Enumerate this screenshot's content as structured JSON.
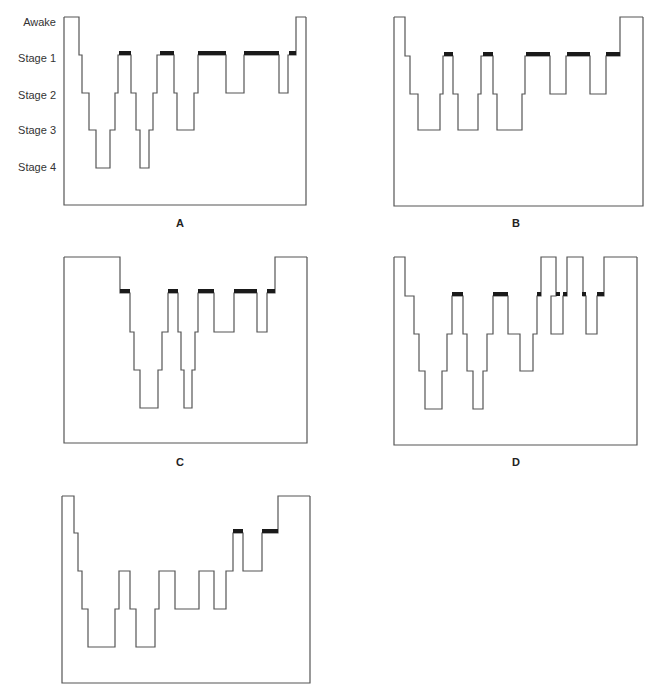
{
  "figure": {
    "stage_labels": [
      "Awake",
      "Stage 1",
      "Stage 2",
      "Stage 3",
      "Stage 4"
    ],
    "panels": [
      {
        "letter": "A",
        "box": {
          "x": 64,
          "y": 17,
          "w": 242,
          "h": 188
        },
        "levels": [
          17,
          55,
          93,
          130,
          168
        ],
        "letter_pos": {
          "x": 170,
          "y": 217
        },
        "steps": [
          [
            64,
            0
          ],
          [
            79,
            1
          ],
          [
            82,
            2
          ],
          [
            89,
            3
          ],
          [
            96,
            4
          ],
          [
            110,
            3
          ],
          [
            115,
            2
          ],
          [
            118,
            1
          ],
          [
            131,
            2
          ],
          [
            136,
            3
          ],
          [
            140,
            4
          ],
          [
            149,
            3
          ],
          [
            153,
            2
          ],
          [
            157,
            1
          ],
          [
            174,
            2
          ],
          [
            177,
            3
          ],
          [
            194,
            2
          ],
          [
            198,
            1
          ],
          [
            226,
            2
          ],
          [
            244,
            1
          ],
          [
            279,
            2
          ],
          [
            288,
            1
          ],
          [
            296,
            0
          ],
          [
            306,
            0
          ]
        ],
        "rem": [
          [
            119,
            131
          ],
          [
            160,
            174
          ],
          [
            198,
            226
          ],
          [
            244,
            279
          ],
          [
            289,
            296
          ]
        ]
      },
      {
        "letter": "B",
        "box": {
          "x": 394,
          "y": 17,
          "w": 249,
          "h": 189
        },
        "levels": [
          17,
          56,
          94,
          130,
          168
        ],
        "letter_pos": {
          "x": 506,
          "y": 217
        },
        "steps": [
          [
            394,
            0
          ],
          [
            405,
            1
          ],
          [
            410,
            2
          ],
          [
            418,
            3
          ],
          [
            440,
            2
          ],
          [
            443,
            1
          ],
          [
            453,
            2
          ],
          [
            458,
            3
          ],
          [
            478,
            2
          ],
          [
            481,
            1
          ],
          [
            493,
            2
          ],
          [
            497,
            3
          ],
          [
            522,
            2
          ],
          [
            525,
            1
          ],
          [
            550,
            2
          ],
          [
            566,
            1
          ],
          [
            590,
            2
          ],
          [
            606,
            1
          ],
          [
            620,
            0
          ],
          [
            643,
            0
          ]
        ],
        "rem": [
          [
            444,
            453
          ],
          [
            483,
            493
          ],
          [
            526,
            550
          ],
          [
            567,
            590
          ],
          [
            606,
            620
          ]
        ]
      },
      {
        "letter": "C",
        "box": {
          "x": 64,
          "y": 257,
          "w": 243,
          "h": 186
        },
        "levels": [
          257,
          293,
          332,
          370,
          408
        ],
        "letter_pos": {
          "x": 170,
          "y": 456
        },
        "steps": [
          [
            64,
            0
          ],
          [
            120,
            1
          ],
          [
            130,
            2
          ],
          [
            134,
            3
          ],
          [
            140,
            4
          ],
          [
            158,
            3
          ],
          [
            162,
            2
          ],
          [
            168,
            1
          ],
          [
            178,
            2
          ],
          [
            181,
            3
          ],
          [
            184,
            4
          ],
          [
            192,
            3
          ],
          [
            195,
            2
          ],
          [
            198,
            1
          ],
          [
            214,
            2
          ],
          [
            234,
            1
          ],
          [
            257,
            2
          ],
          [
            267,
            1
          ],
          [
            275,
            0
          ],
          [
            307,
            0
          ]
        ],
        "rem": [
          [
            120,
            130
          ],
          [
            168,
            178
          ],
          [
            198,
            214
          ],
          [
            234,
            257
          ],
          [
            267,
            275
          ]
        ]
      },
      {
        "letter": "D",
        "box": {
          "x": 394,
          "y": 257,
          "w": 243,
          "h": 188
        },
        "levels": [
          257,
          296,
          334,
          371,
          409
        ],
        "letter_pos": {
          "x": 506,
          "y": 456
        },
        "steps": [
          [
            394,
            0
          ],
          [
            405,
            1
          ],
          [
            414,
            2
          ],
          [
            419,
            3
          ],
          [
            425,
            4
          ],
          [
            442,
            3
          ],
          [
            447,
            2
          ],
          [
            452,
            1
          ],
          [
            463,
            2
          ],
          [
            467,
            3
          ],
          [
            473,
            4
          ],
          [
            483,
            3
          ],
          [
            487,
            2
          ],
          [
            493,
            1
          ],
          [
            508,
            2
          ],
          [
            520,
            3
          ],
          [
            533,
            2
          ],
          [
            537,
            1
          ],
          [
            541,
            0
          ],
          [
            556,
            1
          ],
          [
            551,
            2
          ],
          [
            563,
            2
          ],
          [
            563,
            1
          ],
          [
            567,
            0
          ],
          [
            581,
            0
          ],
          [
            583,
            1
          ],
          [
            586,
            2
          ],
          [
            596,
            2
          ],
          [
            597,
            1
          ],
          [
            604,
            0
          ],
          [
            637,
            0
          ]
        ],
        "rem": [
          [
            452,
            463
          ],
          [
            493,
            508
          ],
          [
            537,
            541
          ],
          [
            556,
            560
          ],
          [
            563,
            567
          ],
          [
            582,
            586
          ],
          [
            597,
            604
          ]
        ]
      },
      {
        "letter": "E",
        "box": {
          "x": 62,
          "y": 496,
          "w": 248,
          "h": 187
        },
        "levels": [
          496,
          533,
          571,
          609,
          647
        ],
        "letter_pos": null,
        "steps": [
          [
            62,
            0
          ],
          [
            74,
            1
          ],
          [
            78,
            2
          ],
          [
            82,
            3
          ],
          [
            88,
            4
          ],
          [
            115,
            3
          ],
          [
            119,
            2
          ],
          [
            130,
            3
          ],
          [
            136,
            4
          ],
          [
            155,
            3
          ],
          [
            159,
            2
          ],
          [
            175,
            3
          ],
          [
            199,
            2
          ],
          [
            214,
            3
          ],
          [
            226,
            2
          ],
          [
            233,
            1
          ],
          [
            243,
            2
          ],
          [
            262,
            1
          ],
          [
            278,
            0
          ],
          [
            310,
            0
          ]
        ],
        "rem": [
          [
            233,
            243
          ],
          [
            262,
            278
          ]
        ]
      }
    ]
  }
}
